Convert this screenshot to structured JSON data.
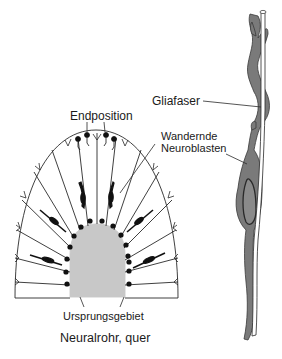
{
  "figure": {
    "left_panel": {
      "caption": "Neuralrohr, quer",
      "labels": {
        "top": "Endposition",
        "bottom": "Ursprungsgebiet",
        "migrating": "Wandernde",
        "migrating_line2": "Neuroblasten"
      }
    },
    "right_panel": {
      "labels": {
        "fiber": "Gliafaser"
      }
    },
    "colors": {
      "line": "#2a2a2a",
      "ventricular_zone": "#c8c8c8",
      "neuroblast_fill": "#7a7a7a",
      "neuroblast_dark": "#3a3a3a",
      "cell_dot": "#111111",
      "background": "#ffffff"
    }
  }
}
